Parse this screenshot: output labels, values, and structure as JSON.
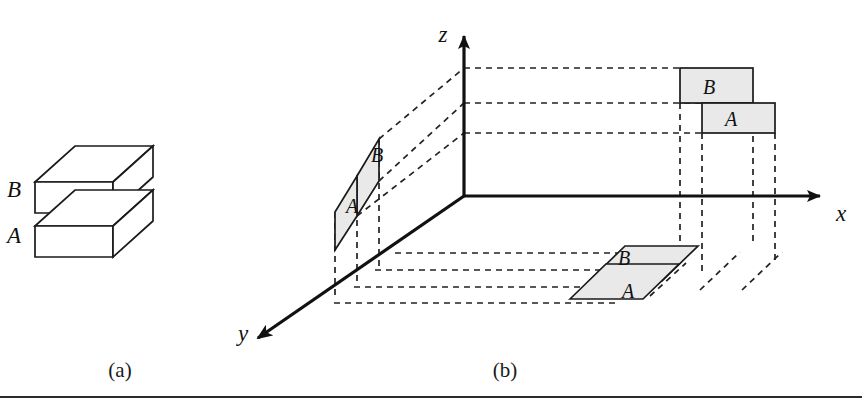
{
  "figure": {
    "background_color": "#ffffff",
    "line_color": "#1a1a1a",
    "projection_fill": "#e9e9e9",
    "dash_color": "#222222"
  },
  "panel_a": {
    "caption": "(a)",
    "blocks": [
      {
        "id": "block-b",
        "label": "B",
        "position": "upper"
      },
      {
        "id": "block-a",
        "label": "A",
        "position": "lower"
      }
    ]
  },
  "panel_b": {
    "caption": "(b)",
    "axes": [
      {
        "id": "x-axis",
        "label": "x",
        "direction": "right"
      },
      {
        "id": "y-axis",
        "label": "y",
        "direction": "down-left"
      },
      {
        "id": "z-axis",
        "label": "z",
        "direction": "up"
      }
    ],
    "projections": {
      "yz_plane": [
        {
          "id": "yz-b",
          "label": "B"
        },
        {
          "id": "yz-a",
          "label": "A"
        }
      ],
      "xz_plane": [
        {
          "id": "xz-b",
          "label": "B"
        },
        {
          "id": "xz-a",
          "label": "A"
        }
      ],
      "xy_plane": [
        {
          "id": "xy-b",
          "label": "B"
        },
        {
          "id": "xy-a",
          "label": "A"
        }
      ]
    }
  }
}
